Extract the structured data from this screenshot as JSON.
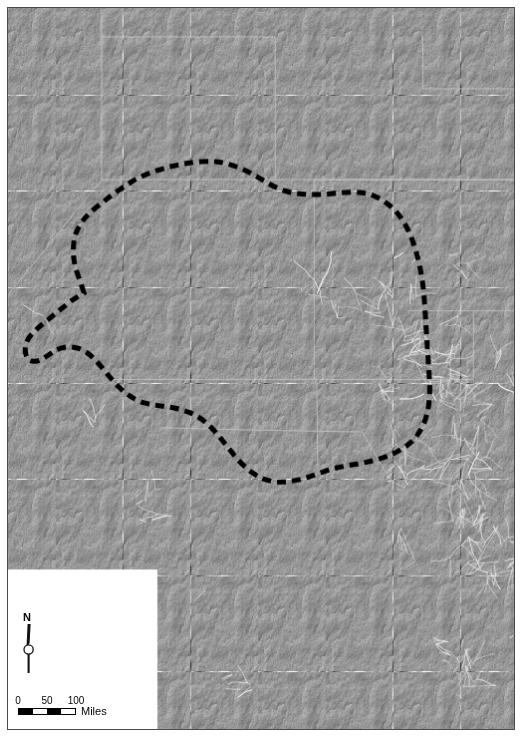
{
  "figure": {
    "kind": "map",
    "frame_visible": true,
    "background_color": "#ffffff",
    "frame_color": "#4a4a4a"
  },
  "map": {
    "basemap_label": "shaded-relief-hillshade",
    "water_label": "Gulf of California / Pacific Ocean",
    "land_base_color": "#8f8f8f",
    "water_color": "#ffffff",
    "river_color": "#f2f2f2",
    "boundary_line_color": "#c8c8c8",
    "study_area_line_color": "#000000",
    "study_area_style": "thick dashed",
    "study_area_dash_px": 9,
    "study_area_gap_px": 6,
    "study_area_width_px": 5
  },
  "north_arrow": {
    "name": "north-arrow",
    "label": "N",
    "style": "needle-with-circle"
  },
  "scale_bar": {
    "name": "scale-bar",
    "units": "Miles",
    "ticks": [
      "0",
      "50",
      "100"
    ],
    "tick_values": [
      0,
      50,
      100
    ],
    "segments": 4,
    "segment_fills": [
      "on",
      "off",
      "on",
      "off"
    ],
    "length_px": 58
  },
  "geography": {
    "water_bodies": [
      "Gulf of California",
      "Pacific Ocean"
    ],
    "landforms": [
      "Baja California Peninsula",
      "Colorado Plateau",
      "Sierra Madre Occidental",
      "Sonoran Desert",
      "Rio Grande Valley"
    ]
  }
}
